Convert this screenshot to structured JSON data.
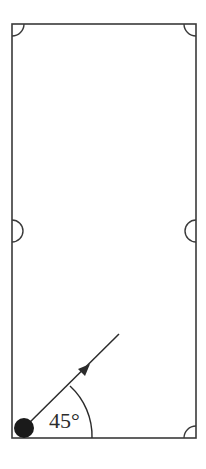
{
  "diagram": {
    "type": "billiard-table-trajectory",
    "table": {
      "left": 12,
      "top": 24,
      "right": 196,
      "bottom": 438,
      "stroke": "#3a3a3a"
    },
    "pockets": [
      {
        "name": "top-left-pocket",
        "kind": "corner"
      },
      {
        "name": "top-right-pocket",
        "kind": "corner"
      },
      {
        "name": "middle-left-pocket",
        "kind": "side"
      },
      {
        "name": "middle-right-pocket",
        "kind": "side"
      },
      {
        "name": "bottom-right-pocket",
        "kind": "corner"
      }
    ],
    "ball": {
      "color": "#1a1a1a"
    },
    "trajectory": {
      "angle_label": "45°",
      "angle_degrees": 45,
      "has_arrow": true
    }
  }
}
